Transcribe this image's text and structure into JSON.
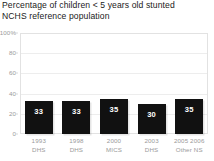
{
  "title": {
    "clipped_above": "Trends in stunting",
    "line1": "Percentage of children < 5 years old stunted",
    "line2": "NCHS reference population"
  },
  "chart_data": {
    "type": "bar",
    "title": "Percentage of children < 5 years old stunted NCHS reference population",
    "xlabel": "",
    "ylabel": "",
    "ylim": [
      0,
      100
    ],
    "grid": true,
    "legend": "none",
    "bar_color": "#111111",
    "label_color": "#ffffff",
    "axis_text_color": "#9a9a9a",
    "categories": [
      "1993\nDHS",
      "1998\nDHS",
      "2000\nMICS",
      "2003\nDHS",
      "2005 2006\nOther NS"
    ],
    "values": [
      33,
      33,
      35,
      30,
      35
    ],
    "yticks": [
      "100%",
      "80",
      "60",
      "40",
      "20",
      "0"
    ],
    "ytick_values": [
      100,
      80,
      60,
      40,
      20,
      0
    ],
    "bars": [
      {
        "year": "1993",
        "source": "DHS",
        "value": 33,
        "label": "33"
      },
      {
        "year": "1998",
        "source": "DHS",
        "value": 33,
        "label": "33"
      },
      {
        "year": "2000",
        "source": "MICS",
        "value": 35,
        "label": "35"
      },
      {
        "year": "2003",
        "source": "DHS",
        "value": 30,
        "label": "30"
      },
      {
        "year": "2005 2006",
        "source": "Other NS",
        "value": 35,
        "label": "35"
      }
    ]
  }
}
